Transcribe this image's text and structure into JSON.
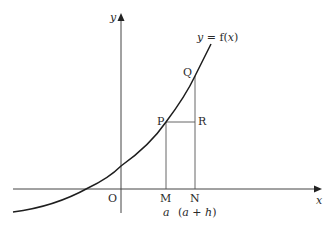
{
  "diagram": {
    "type": "function-graph",
    "curve_label": "y = f(x)",
    "axes": {
      "x_label": "x",
      "y_label": "y",
      "origin_label": "O"
    },
    "points": {
      "P": "P",
      "Q": "Q",
      "R": "R",
      "M": "M",
      "N": "N"
    },
    "x_values": {
      "M": "a",
      "N": "(a + h)"
    },
    "colors": {
      "line": "#3a3a3a",
      "curve": "#1e1e1e",
      "background": "#ffffff"
    }
  }
}
